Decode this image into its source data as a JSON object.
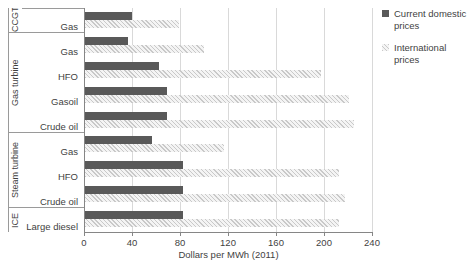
{
  "chart_data": {
    "type": "bar",
    "orientation": "horizontal",
    "title": "",
    "xlabel": "Dollars per MWh (2011)",
    "ylabel": "",
    "xlim": [
      0,
      240
    ],
    "xticks": [
      0,
      40,
      80,
      120,
      160,
      200,
      240
    ],
    "grid": true,
    "legend_position": "right",
    "categories": [
      "Gas",
      "Gas",
      "HFO",
      "Gasoil",
      "Crude oil",
      "Gas",
      "HFO",
      "Crude oil",
      "Large diesel"
    ],
    "groups": [
      {
        "label": "CCGT",
        "count": 1
      },
      {
        "label": "Gas turbine",
        "count": 4
      },
      {
        "label": "Steam turbine",
        "count": 3
      },
      {
        "label": "ICE",
        "count": 1
      }
    ],
    "series": [
      {
        "name": "Current domestic prices",
        "color": "#595959",
        "values": [
          39,
          36,
          62,
          68,
          68,
          56,
          82,
          82,
          82
        ]
      },
      {
        "name": "International prices",
        "color": "#d9d9d9",
        "values": [
          78,
          99,
          197,
          220,
          224,
          116,
          212,
          217,
          212
        ]
      }
    ]
  },
  "legend": {
    "items": [
      {
        "label": "Current domestic prices",
        "swatch": "solid-dark-square"
      },
      {
        "label": "International prices",
        "swatch": "hatched-light-square"
      }
    ]
  },
  "axis": {
    "x_title": "Dollars per MWh (2011)",
    "x_tick_labels": [
      "0",
      "40",
      "80",
      "120",
      "160",
      "200",
      "240"
    ]
  },
  "colors": {
    "domestic": "#595959",
    "international": "#d9d9d9",
    "gridline": "#d9d9d9",
    "axis": "#868686",
    "text": "#3f3f3f",
    "background": "#ffffff"
  }
}
